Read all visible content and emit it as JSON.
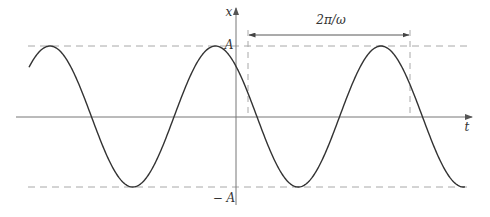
{
  "diagram": {
    "axes": {
      "x_axis_label": "t",
      "y_axis_label": "x"
    },
    "levels": {
      "upper_label": "A",
      "lower_label": "− A"
    },
    "period_marker": {
      "label": "2π/ω"
    },
    "colors": {
      "curve": "#333333",
      "axis": "#777777",
      "dashed": "#a8a8a8",
      "text": "#333333"
    },
    "geometry": {
      "axis_y": 117,
      "axis_x": 236,
      "center_y": 116.5,
      "amplitude_px": 70.5,
      "period_px": 165.5,
      "peak_x": 50,
      "curve_x_start": 29,
      "curve_x_end": 465
    }
  }
}
